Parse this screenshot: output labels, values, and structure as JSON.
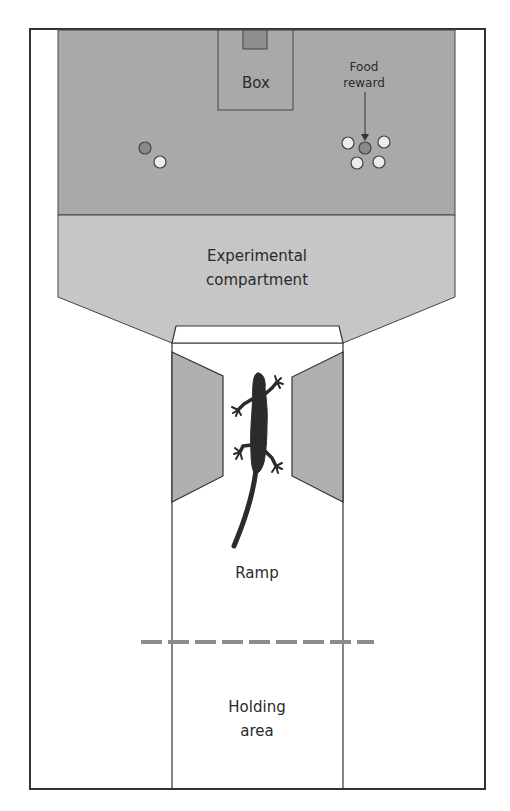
{
  "diagram": {
    "labels": {
      "box": "Box",
      "food_reward_line1": "Food",
      "food_reward_line2": "reward",
      "experimental_line1": "Experimental",
      "experimental_line2": "compartment",
      "ramp": "Ramp",
      "holding_line1": "Holding",
      "holding_line2": "area"
    },
    "icons": {
      "gecko": "gecko-silhouette-icon",
      "arrow": "arrow-down-icon"
    },
    "colors": {
      "outline": "#333333",
      "top_area": "#a9a9a9",
      "experimental_compartment": "#c6c6c6",
      "side_walls": "#b0b0b0",
      "box_tab": "#8e8e8e",
      "dark_dish": "#8a8a8a",
      "light_dish": "#ececec",
      "dashed_line": "#8c8c8c",
      "gecko": "#2b2b2b",
      "background": "#ffffff"
    },
    "dishes": {
      "left": [
        {
          "type": "dark",
          "cx": 145,
          "cy": 148
        },
        {
          "type": "light",
          "cx": 160,
          "cy": 162
        }
      ],
      "right": [
        {
          "type": "dark",
          "cx": 365,
          "cy": 148
        },
        {
          "type": "light",
          "cx": 348,
          "cy": 143
        },
        {
          "type": "light",
          "cx": 384,
          "cy": 142
        },
        {
          "type": "light",
          "cx": 357,
          "cy": 163
        },
        {
          "type": "light",
          "cx": 379,
          "cy": 162
        }
      ]
    }
  }
}
